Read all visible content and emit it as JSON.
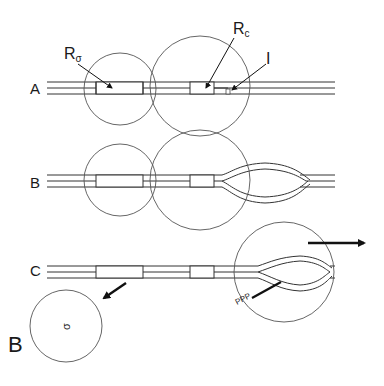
{
  "figure": {
    "panel_label": "B",
    "rows": [
      {
        "label": "A",
        "description": "Linear DNA with two replication origins (R-sigma and Rc) enclosed by circles; I marks a site"
      },
      {
        "label": "B",
        "description": "Replication bubble forming at Rc region"
      },
      {
        "label": "C",
        "description": "Sigma circle released (arrow down-left); replicating circle moves right"
      }
    ],
    "annotations": {
      "r_sigma": {
        "main": "R",
        "sub": "σ"
      },
      "r_c": {
        "main": "R",
        "sub": "c"
      },
      "i_label": "I",
      "ppp_label": "PPP",
      "sigma_circle_label": "σ"
    },
    "arrows": [
      {
        "name": "release-arrow",
        "direction": "down-left"
      },
      {
        "name": "movement-arrow",
        "direction": "right"
      }
    ]
  }
}
